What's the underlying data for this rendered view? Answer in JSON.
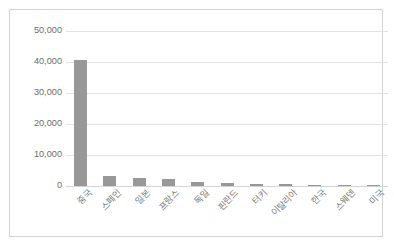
{
  "chart_data": {
    "type": "bar",
    "title": "",
    "subtitle": "",
    "xlabel": "",
    "ylabel": "",
    "categories": [
      "중국",
      "스페인",
      "일본",
      "프랑스",
      "독일",
      "핀란드",
      "터키",
      "이탈리아",
      "한국",
      "스웨덴",
      "미국"
    ],
    "values": [
      40500,
      3200,
      2600,
      2200,
      1200,
      850,
      700,
      600,
      450,
      400,
      300
    ],
    "series": [
      {
        "name": "",
        "values": [
          40500,
          3200,
          2600,
          2200,
          1200,
          850,
          700,
          600,
          450,
          400,
          300
        ]
      }
    ],
    "ylim": [
      0,
      50000
    ],
    "yticks": [
      0,
      10000,
      20000,
      30000,
      40000,
      50000
    ],
    "ytick_labels": [
      "0",
      "10,000",
      "20,000",
      "30,000",
      "40,000",
      "50,000"
    ],
    "grid": true,
    "legend": false,
    "legend_position": "none",
    "bar_color": "#989898",
    "gridline_color": "#e2e2e2",
    "axis_label_color": "#6d6d6d",
    "plot_background": "#ffffff",
    "frame_border_color": "#d2d2d2",
    "x_label_rotation": -45
  }
}
